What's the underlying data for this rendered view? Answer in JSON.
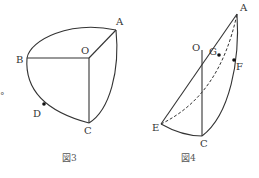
{
  "figures": [
    {
      "caption": "図3",
      "labels": {
        "A": "A",
        "O": "O",
        "B": "B",
        "C": "C",
        "D": "D"
      },
      "marked_points": [
        "D"
      ]
    },
    {
      "caption": "図4",
      "labels": {
        "A": "A",
        "O": "O",
        "G": "G",
        "F": "F",
        "E": "E",
        "C": "C"
      },
      "marked_points": [
        "G",
        "F"
      ]
    }
  ],
  "margin_mark": "°"
}
